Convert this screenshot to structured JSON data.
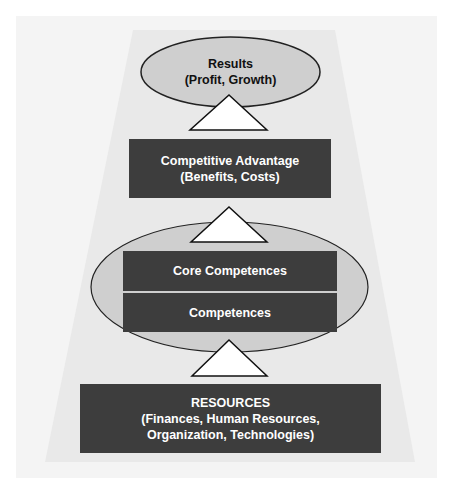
{
  "diagram": {
    "type": "hierarchy-pyramid",
    "colors": {
      "page_background": "#ffffff",
      "outer_panel": "#f4f4f4",
      "trapezoid": "#e9e9e9",
      "dark_box": "#3d3d3d",
      "ellipse_fill": "#cfcfcf",
      "ellipse_stroke": "#222222",
      "arrow_fill": "#ffffff",
      "text_on_dark": "#ffffff",
      "text_on_light": "#111111"
    },
    "results": {
      "title": "Results",
      "subtitle": "(Profit, Growth)"
    },
    "competitive_advantage": {
      "title": "Competitive Advantage",
      "subtitle": "(Benefits, Costs)"
    },
    "competences_group": {
      "core": "Core Competences",
      "base": "Competences"
    },
    "resources": {
      "title": "RESOURCES",
      "line1": "(Finances, Human Resources,",
      "line2": "Organization, Technologies)"
    },
    "arrows": [
      {
        "from": "competitive_advantage",
        "to": "results"
      },
      {
        "from": "competences_group",
        "to": "competitive_advantage"
      },
      {
        "from": "resources",
        "to": "competences_group"
      }
    ]
  }
}
